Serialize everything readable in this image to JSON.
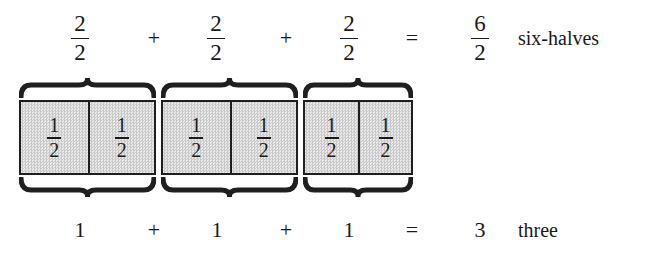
{
  "figure": {
    "fill_color": "#dcdcdc",
    "line_color": "#1f1f1f",
    "background_color": "#ffffff"
  },
  "top_row": {
    "terms": [
      {
        "numerator": "2",
        "denominator": "2"
      },
      {
        "numerator": "2",
        "denominator": "2"
      },
      {
        "numerator": "2",
        "denominator": "2"
      }
    ],
    "plus_1": "+",
    "plus_2": "+",
    "equals": "=",
    "result": {
      "numerator": "6",
      "denominator": "2"
    },
    "label": "six-halves"
  },
  "groups": [
    {
      "cells": [
        {
          "numerator": "1",
          "denominator": "2"
        },
        {
          "numerator": "1",
          "denominator": "2"
        }
      ]
    },
    {
      "cells": [
        {
          "numerator": "1",
          "denominator": "2"
        },
        {
          "numerator": "1",
          "denominator": "2"
        }
      ]
    },
    {
      "cells": [
        {
          "numerator": "1",
          "denominator": "2"
        },
        {
          "numerator": "1",
          "denominator": "2"
        }
      ]
    }
  ],
  "bottom_row": {
    "terms": [
      "1",
      "1",
      "1"
    ],
    "plus_1": "+",
    "plus_2": "+",
    "equals": "=",
    "result": "3",
    "label": "three"
  }
}
